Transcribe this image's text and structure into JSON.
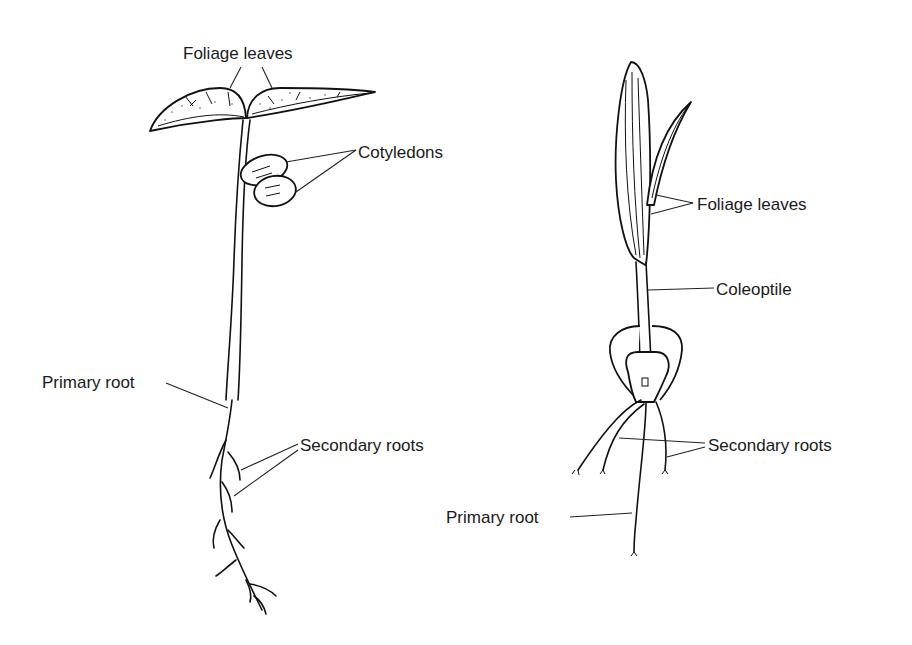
{
  "figure": {
    "background": "#ffffff",
    "ink_color": "#111111",
    "panels": [
      {
        "id": "dicot-seedling",
        "labels": [
          {
            "key": "foliage",
            "text": "Foliage leaves"
          },
          {
            "key": "cotyledons",
            "text": "Cotyledons"
          },
          {
            "key": "primary_root",
            "text": "Primary root"
          },
          {
            "key": "secondary_roots",
            "text": "Secondary roots"
          }
        ]
      },
      {
        "id": "monocot-seedling",
        "labels": [
          {
            "key": "foliage",
            "text": "Foliage leaves"
          },
          {
            "key": "coleoptile",
            "text": "Coleoptile"
          },
          {
            "key": "secondary_roots",
            "text": "Secondary roots"
          },
          {
            "key": "primary_root",
            "text": "Primary root"
          }
        ]
      }
    ]
  }
}
